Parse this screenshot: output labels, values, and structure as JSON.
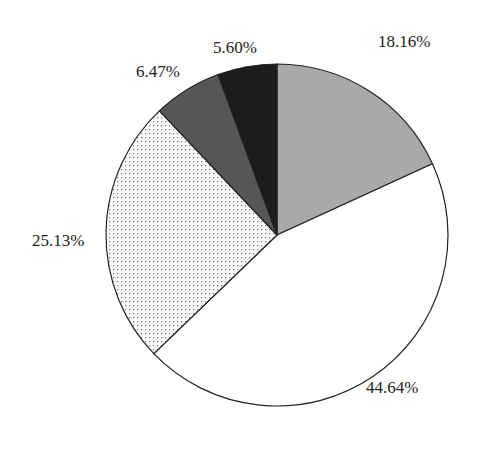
{
  "chart_data": {
    "type": "pie",
    "title": "",
    "start_angle": "12 o'clock",
    "direction": "clockwise",
    "slices": [
      {
        "label": "18.16%",
        "value": 18.16,
        "fill": "#a9a9a9",
        "pattern": "fine-texture"
      },
      {
        "label": "44.64%",
        "value": 44.64,
        "fill": "#ffffff",
        "pattern": "none"
      },
      {
        "label": "25.13%",
        "value": 25.13,
        "fill": "#f4f4f4",
        "pattern": "dots"
      },
      {
        "label": "6.47%",
        "value": 6.47,
        "fill": "#565656",
        "pattern": "fine-texture"
      },
      {
        "label": "5.60%",
        "value": 5.6,
        "fill": "#1c1c1c",
        "pattern": "fine-texture"
      }
    ],
    "legend": "none"
  },
  "labels": {
    "s0": "18.16%",
    "s1": "44.64%",
    "s2": "25.13%",
    "s3": "6.47%",
    "s4": "5.60%"
  }
}
